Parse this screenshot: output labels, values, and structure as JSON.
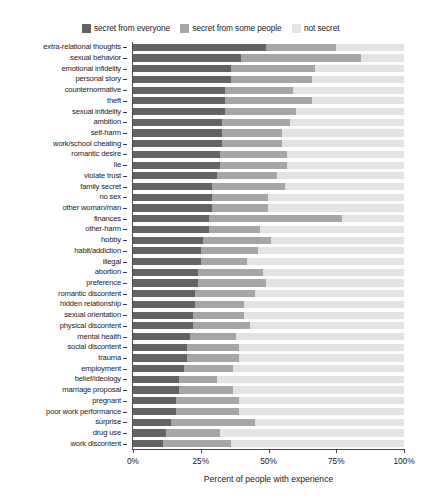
{
  "chart_data": {
    "type": "bar",
    "orientation": "horizontal",
    "stacked": true,
    "title": "",
    "xlabel": "Percent of people with experience",
    "ylabel": "",
    "xlim": [
      0,
      100
    ],
    "xticks": [
      0,
      25,
      50,
      75,
      100
    ],
    "xticklabels": [
      "0%",
      "25%",
      "50%",
      "75%",
      "100%"
    ],
    "grid": false,
    "legend_position": "top-center",
    "colors": {
      "secret_from_everyone": "#636363",
      "secret_from_some_people": "#a6a6a6",
      "not_secret": "#e3e3e3"
    },
    "series": [
      {
        "name": "secret from everyone",
        "color": "#636363"
      },
      {
        "name": "secret from some people",
        "color": "#a6a6a6"
      },
      {
        "name": "not secret",
        "color": "#e3e3e3"
      }
    ],
    "categories": [
      "extra-relational thoughts",
      "sexual behavior",
      "emotional infidelity",
      "personal story",
      "counternormative",
      "theft",
      "sexual infidelity",
      "ambition",
      "self-harm",
      "work/school cheating",
      "romantic desire",
      "lie",
      "violate trust",
      "family secret",
      "no sex",
      "other woman/man",
      "finances",
      "other-harm",
      "hobby",
      "habit/addiction",
      "illegal",
      "abortion",
      "preference",
      "romantic discontent",
      "hidden relationship",
      "sexual orientation",
      "physical discontent",
      "mental health",
      "social discontent",
      "trauma",
      "employment",
      "belief/ideology",
      "marriage proposal",
      "pregnant",
      "poor work performance",
      "surprise",
      "drug use",
      "work discontent"
    ],
    "values": {
      "secret_from_everyone": [
        49,
        40,
        36,
        36,
        34,
        34,
        34,
        33,
        33,
        33,
        32,
        32,
        31,
        29,
        29,
        29,
        28,
        28,
        26,
        25,
        25,
        24,
        24,
        23,
        23,
        22,
        22,
        21,
        20,
        20,
        19,
        17,
        17,
        16,
        16,
        14,
        12,
        11
      ],
      "secret_from_some_people": [
        26,
        44,
        31,
        30,
        25,
        32,
        26,
        25,
        22,
        22,
        25,
        25,
        22,
        27,
        21,
        21,
        49,
        19,
        25,
        21,
        17,
        24,
        25,
        22,
        18,
        19,
        21,
        17,
        19,
        19,
        18,
        14,
        20,
        23,
        23,
        31,
        20,
        25
      ],
      "not_secret": [
        25,
        16,
        33,
        34,
        41,
        34,
        40,
        42,
        45,
        45,
        43,
        43,
        47,
        44,
        50,
        50,
        23,
        53,
        49,
        54,
        58,
        52,
        51,
        55,
        59,
        59,
        57,
        62,
        61,
        61,
        63,
        69,
        63,
        61,
        61,
        55,
        68,
        64
      ]
    }
  },
  "legend": {
    "entries": [
      {
        "label": "secret from everyone",
        "color": "#636363"
      },
      {
        "label": "secret from some people",
        "color": "#a6a6a6"
      },
      {
        "label": "not secret",
        "color": "#e3e3e3"
      }
    ]
  },
  "axis": {
    "x_title": "Percent of people with experience",
    "x_tick_labels": [
      "0%",
      "25%",
      "50%",
      "75%",
      "100%"
    ]
  }
}
